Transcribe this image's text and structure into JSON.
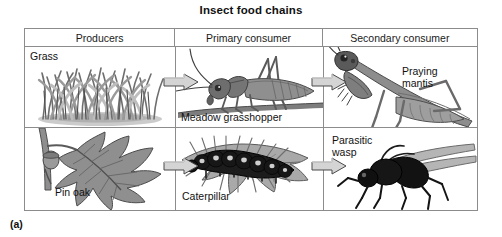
{
  "figure": {
    "title": "Insect food chains",
    "label": "(a)"
  },
  "table": {
    "headers": [
      "Producers",
      "Primary consumer",
      "Secondary consumer"
    ],
    "rows": [
      {
        "name": "grass-food-chain",
        "cells": [
          {
            "caption": "Grass",
            "organism": "grass-tuft-illustration"
          },
          {
            "caption": "Meadow grasshopper",
            "organism": "grasshopper-illustration"
          },
          {
            "caption": "Praying\nmantis",
            "organism": "praying-mantis-illustration"
          }
        ]
      },
      {
        "name": "oak-food-chain",
        "cells": [
          {
            "caption": "Pin oak",
            "organism": "oak-leaf-acorn-illustration"
          },
          {
            "caption": "Caterpillar",
            "organism": "caterpillar-on-leaf-illustration"
          },
          {
            "caption": "Parasitic\nwasp",
            "organism": "parasitic-wasp-illustration"
          }
        ]
      }
    ],
    "arrows": [
      {
        "name": "arrow-grass-to-grasshopper",
        "glyph": "block-arrow-right"
      },
      {
        "name": "arrow-grasshopper-to-mantis",
        "glyph": "block-arrow-right"
      },
      {
        "name": "arrow-oak-to-caterpillar",
        "glyph": "block-arrow-right"
      },
      {
        "name": "arrow-caterpillar-to-wasp",
        "glyph": "block-arrow-right"
      }
    ]
  },
  "colors": {
    "border": "#8c8c8c",
    "arrow_fill": "#d4d4d4",
    "arrow_stroke": "#4a4a4a",
    "illustration_dark": "#4f4f4f",
    "illustration_mid": "#8a8a8a",
    "illustration_light": "#bcbcbc",
    "background": "#ffffff"
  }
}
